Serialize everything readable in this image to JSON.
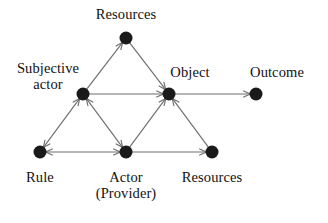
{
  "diagram": {
    "background_color": "#ffffff",
    "node_color": "#1a1a1a",
    "edge_color": "#6e6e6e",
    "node_radius": 6.5,
    "nodes": [
      {
        "id": "resources_top",
        "label": "Resources",
        "x": 126,
        "y": 38,
        "label_x": 126,
        "label_y": 6,
        "label_align": "center"
      },
      {
        "id": "subjective_actor",
        "label": "Subjective\nactor",
        "x": 83,
        "y": 94,
        "label_x": 48,
        "label_y": 60,
        "label_align": "center"
      },
      {
        "id": "object",
        "label": "Object",
        "x": 169,
        "y": 94,
        "label_x": 190,
        "label_y": 64,
        "label_align": "center"
      },
      {
        "id": "outcome",
        "label": "Outcome",
        "x": 256,
        "y": 94,
        "label_x": 277,
        "label_y": 64,
        "label_align": "center"
      },
      {
        "id": "rule",
        "label": "Rule",
        "x": 40,
        "y": 152,
        "label_x": 40,
        "label_y": 169,
        "label_align": "center"
      },
      {
        "id": "actor_provider",
        "label": "Actor\n(Provider)",
        "x": 126,
        "y": 152,
        "label_x": 126,
        "label_y": 169,
        "label_align": "center"
      },
      {
        "id": "resources_bottom",
        "label": "Resources",
        "x": 212,
        "y": 152,
        "label_x": 212,
        "label_y": 169,
        "label_align": "center"
      }
    ],
    "edges": [
      {
        "id": "subjective-actor-to-resources-top",
        "from": "subjective_actor",
        "to": "resources_top",
        "arrow": "forward"
      },
      {
        "id": "resources-top-to-object",
        "from": "resources_top",
        "to": "object",
        "arrow": "forward"
      },
      {
        "id": "subjective-actor-to-object",
        "from": "subjective_actor",
        "to": "object",
        "arrow": "forward"
      },
      {
        "id": "subjective-actor-to-rule",
        "from": "subjective_actor",
        "to": "rule",
        "arrow": "both"
      },
      {
        "id": "subjective-actor-to-actor",
        "from": "subjective_actor",
        "to": "actor_provider",
        "arrow": "both"
      },
      {
        "id": "rule-to-actor",
        "from": "rule",
        "to": "actor_provider",
        "arrow": "both"
      },
      {
        "id": "actor-to-object",
        "from": "actor_provider",
        "to": "object",
        "arrow": "forward"
      },
      {
        "id": "actor-to-resources-bottom",
        "from": "actor_provider",
        "to": "resources_bottom",
        "arrow": "forward"
      },
      {
        "id": "resources-bottom-to-object",
        "from": "resources_bottom",
        "to": "object",
        "arrow": "forward"
      },
      {
        "id": "object-to-outcome",
        "from": "object",
        "to": "outcome",
        "arrow": "forward"
      }
    ]
  }
}
